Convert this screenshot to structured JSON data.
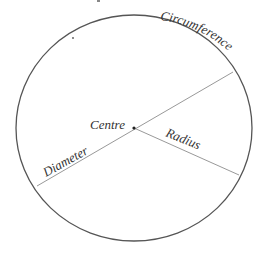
{
  "diagram": {
    "type": "circle-parts",
    "labels": {
      "circumference": "Circumference",
      "centre": "Centre",
      "radius": "Radius",
      "diameter": "Diameter"
    },
    "colors": {
      "circle_stroke": "#555555",
      "line_stroke": "#999999",
      "text": "#333333"
    }
  }
}
